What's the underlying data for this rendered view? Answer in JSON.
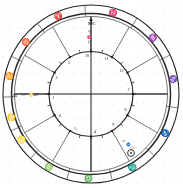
{
  "chart_data": {
    "type": "diagram",
    "diagram_kind": "astrological-natal-chart-wheel",
    "background_color": "#ffffff",
    "ink_color": "#1d1d1d",
    "geometry": {
      "center_x": 91,
      "center_y": 94,
      "outer_ring_outer_radius": 88,
      "outer_ring_inner_radius": 79,
      "house_band_outer_radius": 79,
      "inner_circle_radius": 42,
      "ascendant_angle_deg": 180,
      "midheaven_angle_deg": 90
    },
    "zodiac_signs": [
      {
        "name": "Aries",
        "glyph": "♈",
        "label": "Ari",
        "ring_angle_deg": 113
      },
      {
        "name": "Pisces",
        "glyph": "♓",
        "label": "Pis",
        "ring_angle_deg": 75
      },
      {
        "name": "Aquarius",
        "glyph": "♒",
        "label": "Aqu",
        "ring_angle_deg": 42
      },
      {
        "name": "Capricorn",
        "glyph": "♑",
        "label": "Cap",
        "ring_angle_deg": 10
      },
      {
        "name": "Sagittarius",
        "glyph": "♐",
        "label": "Sag",
        "ring_angle_deg": 332
      },
      {
        "name": "Scorpio",
        "glyph": "♏",
        "label": "Sco",
        "ring_angle_deg": 300
      },
      {
        "name": "Libra",
        "glyph": "♎",
        "label": "Lib",
        "ring_angle_deg": 268
      },
      {
        "name": "Virgo",
        "glyph": "♍",
        "label": "Vir",
        "ring_angle_deg": 240
      },
      {
        "name": "Leo",
        "glyph": "♌",
        "label": "Leo",
        "ring_angle_deg": 213
      },
      {
        "name": "Cancer",
        "glyph": "♋",
        "label": "Can",
        "ring_angle_deg": 196
      },
      {
        "name": "Gemini",
        "glyph": "♊",
        "label": "Gem",
        "ring_angle_deg": 168
      },
      {
        "name": "Taurus",
        "glyph": "♉",
        "label": "Tau",
        "ring_angle_deg": 142
      }
    ],
    "houses": [
      {
        "number": "1",
        "cusp_angle_deg": 180
      },
      {
        "number": "2",
        "cusp_angle_deg": 150
      },
      {
        "number": "3",
        "cusp_angle_deg": 120
      },
      {
        "number": "4",
        "cusp_angle_deg": 270
      },
      {
        "number": "5",
        "cusp_angle_deg": 240
      },
      {
        "number": "6",
        "cusp_angle_deg": 210
      },
      {
        "number": "7",
        "cusp_angle_deg": 0
      },
      {
        "number": "8",
        "cusp_angle_deg": 330
      },
      {
        "number": "9",
        "cusp_angle_deg": 300
      },
      {
        "number": "10",
        "cusp_angle_deg": 90
      },
      {
        "number": "11",
        "cusp_angle_deg": 60
      },
      {
        "number": "12",
        "cusp_angle_deg": 30
      }
    ],
    "house_number_labels": [
      "10",
      "11",
      "12",
      "1",
      "2",
      "3",
      "4",
      "5",
      "6",
      "7",
      "8",
      "9"
    ],
    "axes": [
      {
        "id": "ascendant",
        "label": "As",
        "degree_text": "17° ♋ 48'",
        "angle_deg": 180
      },
      {
        "id": "midheaven",
        "label": "MC",
        "degree_text": "9° ♓ 52'",
        "angle_deg": 90,
        "orientation": "vertical"
      }
    ],
    "planets": [
      {
        "name": "Sun",
        "glyph": "☉",
        "degree_text": "4° ♐ 21'",
        "angle_deg": 312
      }
    ],
    "tick_marks": {
      "count": 24,
      "inner_circle_radius": 42,
      "length": 3
    }
  },
  "labels": {
    "ascendant_short": "As",
    "midheaven_short": "MC",
    "sun_short": "Sun"
  }
}
